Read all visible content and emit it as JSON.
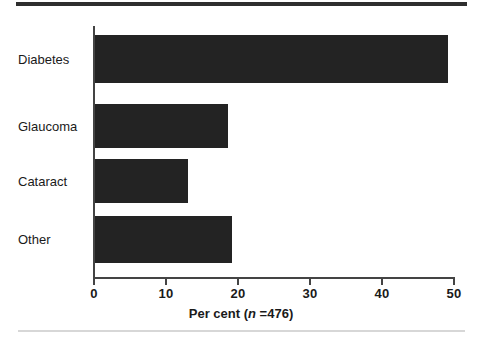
{
  "figure": {
    "background_color": "#ffffff",
    "bar_color": "#232323",
    "axis_color": "#444444",
    "rule_top_color": "#2e2e2e",
    "rule_bottom_color": "#d7d7d7"
  },
  "axis_title": {
    "prefix": "Per cent (",
    "italic_symbol": "n",
    "suffix": " =476)"
  },
  "chart_data": {
    "type": "bar",
    "orientation": "horizontal",
    "title": "",
    "subtitle": "",
    "xlabel": "Per cent (n =476)",
    "ylabel": "",
    "categories": [
      "Diabetes",
      "Glaucoma",
      "Cataract",
      "Other"
    ],
    "values": [
      49.2,
      18.5,
      12.9,
      19.1
    ],
    "xlim": [
      0,
      50
    ],
    "xticks": [
      0,
      10,
      20,
      30,
      40,
      50
    ],
    "xticklabels": [
      "0",
      "10",
      "20",
      "30",
      "40",
      "50"
    ],
    "grid": false,
    "legend": false,
    "legend_position": "none",
    "annotations": [],
    "n": 476
  }
}
